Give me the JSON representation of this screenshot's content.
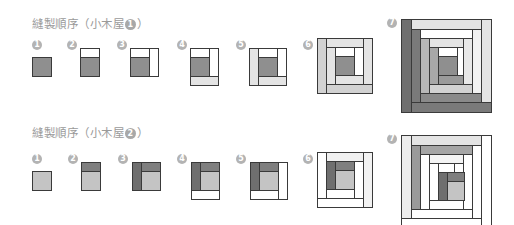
{
  "colors": {
    "dark": "#6f6f6f",
    "mid": "#8f8f8f",
    "center": "#959595",
    "light": "#d2d2d2",
    "lighter": "#e4e4e4",
    "white": "#ffffff",
    "stroke": "#3a3a3a",
    "label": "#9a9a9a",
    "badge": "#b3b3b3"
  },
  "sections": [
    {
      "title_prefix": "縫製順序（小木屋",
      "title_num": "1",
      "title_suffix": "）",
      "steps": [
        {
          "n": "1"
        },
        {
          "n": "2"
        },
        {
          "n": "3"
        },
        {
          "n": "4"
        },
        {
          "n": "5"
        },
        {
          "n": "6"
        },
        {
          "n": "7"
        }
      ]
    },
    {
      "title_prefix": "縫製順序（小木屋",
      "title_num": "2",
      "title_suffix": "）",
      "steps": [
        {
          "n": "1"
        },
        {
          "n": "2"
        },
        {
          "n": "3"
        },
        {
          "n": "4"
        },
        {
          "n": "5"
        },
        {
          "n": "6"
        },
        {
          "n": "7"
        }
      ]
    }
  ]
}
